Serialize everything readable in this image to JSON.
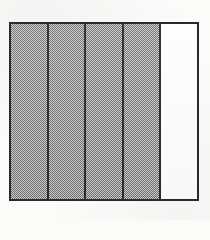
{
  "figure": {
    "kind": "fraction-bar-diagram",
    "title": "",
    "caption": "",
    "total_parts": 5,
    "shaded_parts": 4,
    "unshaded_parts": 1,
    "fraction_label": "",
    "orientation": "vertical-columns",
    "colors": {
      "background": "#fbfbfa",
      "outline": "#2a2a2a",
      "shaded_fill": "#9a9a9a",
      "unshaded_fill": "#fdfdfd"
    },
    "cells": [
      {
        "index": 1,
        "state": "shaded",
        "label": ""
      },
      {
        "index": 2,
        "state": "shaded",
        "label": ""
      },
      {
        "index": 3,
        "state": "shaded",
        "label": ""
      },
      {
        "index": 4,
        "state": "shaded",
        "label": ""
      },
      {
        "index": 5,
        "state": "unshaded",
        "label": ""
      }
    ]
  },
  "chart_data": {
    "type": "bar",
    "title": "",
    "xlabel": "",
    "ylabel": "",
    "categories": [
      "1",
      "2",
      "3",
      "4",
      "5"
    ],
    "values": [
      1,
      1,
      1,
      1,
      0
    ],
    "series": [
      {
        "name": "shaded",
        "values": [
          1,
          1,
          1,
          1,
          0
        ]
      }
    ],
    "ylim": [
      0,
      1
    ],
    "grid": false,
    "legend": "none",
    "annotations": []
  }
}
